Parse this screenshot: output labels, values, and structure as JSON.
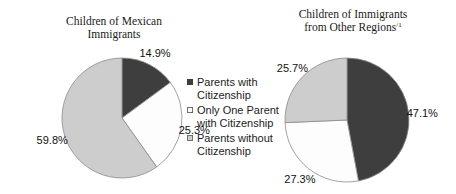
{
  "figure": {
    "background": "#ffffff",
    "text_color": "#1a1a1a",
    "label_color": "#111111",
    "slice_stroke": "#8a8a8a"
  },
  "legend": {
    "position": "center-between-pies",
    "items": [
      {
        "label": "Parents with Citizenship",
        "lines": [
          "Parents with",
          "Citizenship"
        ],
        "swatch_color": "#3e3e3e",
        "swatch_border": "#3e3e3e"
      },
      {
        "label": "Only One Parent with Citizenship",
        "lines": [
          "Only One Parent",
          "with Citizenship"
        ],
        "swatch_color": "#fdfdfd",
        "swatch_border": "#707070"
      },
      {
        "label": "Parents without Citizenship",
        "lines": [
          "Parents without",
          "Citizenship"
        ],
        "swatch_color": "#cdcdcd",
        "swatch_border": "#707070"
      }
    ]
  },
  "chart_data": [
    {
      "type": "pie",
      "title": "Children of Mexican Immigrants",
      "title_lines": [
        "Children of Mexican",
        "Immigrants"
      ],
      "categories": [
        "Parents with Citizenship",
        "Only One Parent with Citizenship",
        "Parents without Citizenship"
      ],
      "values": [
        14.9,
        25.3,
        59.8
      ],
      "labels": [
        "14.9%",
        "25.3%",
        "59.8%"
      ],
      "colors": [
        "#3e3e3e",
        "#fdfdfd",
        "#cdcdcd"
      ],
      "start_angle_deg": 0,
      "direction": "clockwise",
      "legend_position": "right-of-chart"
    },
    {
      "type": "pie",
      "title": "Children of Immigrants from Other Regions",
      "title_lines": [
        "Children of Immigrants",
        "from Other Regions"
      ],
      "title_superscript": "/1",
      "categories": [
        "Parents with Citizenship",
        "Only One Parent with Citizenship",
        "Parents without Citizenship"
      ],
      "values": [
        47.1,
        27.3,
        25.7
      ],
      "labels": [
        "47.1%",
        "27.3%",
        "25.7%"
      ],
      "colors": [
        "#3e3e3e",
        "#fdfdfd",
        "#cdcdcd"
      ],
      "start_angle_deg": 0,
      "direction": "clockwise",
      "legend_position": "left-of-chart"
    }
  ]
}
